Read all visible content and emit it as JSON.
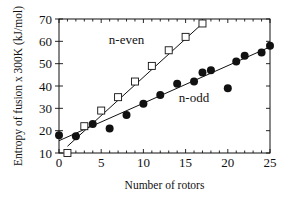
{
  "chart_data": {
    "type": "scatter",
    "title": "",
    "xlabel": "Number of rotors",
    "ylabel": "Entropy of fusion x 300K (kJ/mol)",
    "xlim": [
      0,
      25
    ],
    "ylim": [
      10,
      70
    ],
    "xticks": [
      0,
      5,
      10,
      15,
      20,
      25
    ],
    "yticks": [
      10,
      20,
      30,
      40,
      50,
      60,
      70
    ],
    "grid": false,
    "legend": "none (inline annotations)",
    "annotations": [
      {
        "text": "n-even",
        "x": 8,
        "y": 59
      },
      {
        "text": "n-odd",
        "x": 16,
        "y": 33
      }
    ],
    "series": [
      {
        "name": "n-even",
        "marker": "open-square",
        "x": [
          1,
          3,
          5,
          7,
          9,
          11,
          13,
          15,
          17
        ],
        "y": [
          10,
          22,
          29,
          35,
          42,
          49,
          56,
          62,
          68
        ],
        "fit_line": {
          "x0": 1,
          "y0": 13,
          "x1": 17,
          "y1": 68
        }
      },
      {
        "name": "n-odd",
        "marker": "filled-circle",
        "x": [
          0,
          2,
          4,
          6,
          8,
          10,
          12,
          14,
          16,
          17,
          18,
          20,
          21,
          22,
          24,
          25
        ],
        "y": [
          18,
          17.5,
          23,
          21,
          27,
          32,
          36,
          41,
          42,
          46,
          47,
          39,
          51,
          53.5,
          55,
          58
        ],
        "fit_line": {
          "x0": 0,
          "y0": 15.5,
          "x1": 25,
          "y1": 57.5
        }
      }
    ]
  }
}
